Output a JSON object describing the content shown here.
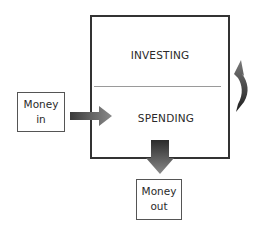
{
  "diagram": {
    "main_box": {
      "top_section_label": "INVESTING",
      "bottom_section_label": "SPENDING"
    },
    "input_box": {
      "line1": "Money",
      "line2": "in"
    },
    "output_box": {
      "line1": "Money",
      "line2": "out"
    },
    "arrows": [
      {
        "name": "money-in-arrow",
        "from": "Money in",
        "to": "SPENDING",
        "direction": "right"
      },
      {
        "name": "money-out-arrow",
        "from": "SPENDING",
        "to": "Money out",
        "direction": "down"
      },
      {
        "name": "cycle-arrow",
        "from": "SPENDING",
        "to": "INVESTING",
        "direction": "curved-up",
        "side": "right"
      }
    ],
    "colors": {
      "border": "#333333",
      "arrow_dark": "#2b2b2b",
      "arrow_light": "#8a8a8a",
      "divider": "#9a9a9a"
    }
  }
}
